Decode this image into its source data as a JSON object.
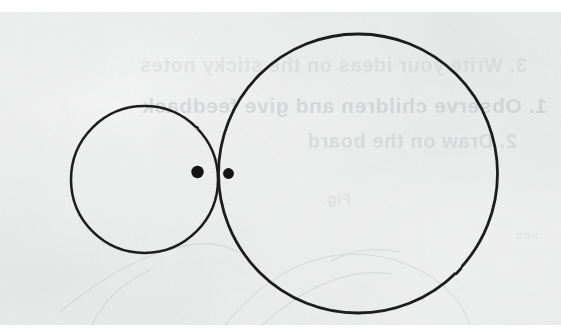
{
  "document": {
    "title": "Two externally tangent circles",
    "media": "scanned-paper",
    "background_color": "#eaebeb",
    "ink_color": "#1a1a1a",
    "page_margin_color": "#ffffff"
  },
  "canvas": {
    "width": 561,
    "height": 336,
    "paper_top": 12,
    "paper_height": 313
  },
  "diagram": {
    "type": "geometry-figure",
    "stroke_color": "#1c1c1c",
    "stroke_width": 2.6,
    "fill": "none",
    "shapes": [
      {
        "name": "small-circle",
        "kind": "circle",
        "cx": 144.5,
        "cy": 179.5,
        "r": 73.5,
        "stroke_width": 2.5
      },
      {
        "name": "large-circle",
        "kind": "circle",
        "cx": 358.0,
        "cy": 173.5,
        "r": 139.5,
        "stroke_width": 2.8
      }
    ],
    "points": [
      {
        "name": "small-circle-centre-dot",
        "kind": "dot",
        "cx": 197.5,
        "cy": 172.0,
        "r": 6.2,
        "fill": "#141414"
      },
      {
        "name": "large-circle-centre-dot",
        "kind": "dot",
        "cx": 228.5,
        "cy": 173.5,
        "r": 5.4,
        "fill": "#141414"
      }
    ],
    "tangency": {
      "name": "tangent-point",
      "x": 218.5,
      "y": 176.0,
      "relation": "externally tangent"
    }
  },
  "showthrough": {
    "note": "Faint mirrored text bleeding through from the reverse side of the sheet",
    "lines": [
      {
        "id": "st-1",
        "text": "3. Write your ideas on the sticky notes"
      },
      {
        "id": "st-2",
        "text": "1. Observe children and give feedback"
      },
      {
        "id": "st-3",
        "text": "2. Draw on the board"
      },
      {
        "id": "st-4",
        "text": "Fig."
      },
      {
        "id": "st-5",
        "text": "see"
      }
    ]
  }
}
